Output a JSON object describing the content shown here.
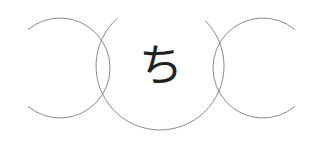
{
  "center_character": "ち",
  "colors": {
    "background": "#ffffff",
    "ring_stroke": "#8a8a8a",
    "character": "#222222"
  },
  "rings": [
    {
      "name": "left-ring",
      "cx": 60,
      "cy": 68,
      "r": 50,
      "opening": "left"
    },
    {
      "name": "center-ring",
      "cx": 160,
      "cy": 66,
      "r": 64,
      "opening": "top"
    },
    {
      "name": "right-ring",
      "cx": 263,
      "cy": 68,
      "r": 50,
      "opening": "right"
    }
  ]
}
